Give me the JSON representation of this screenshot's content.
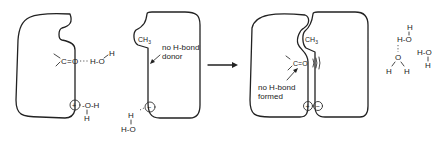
{
  "diagram": {
    "left_protein": {
      "carbonyl_C": "C",
      "carbonyl_bond": "=",
      "carbonyl_O": "O",
      "water_hbond": "H-O",
      "water_H_top": "H",
      "charge": "+",
      "charged_water_OH": "-O-H",
      "charged_water_H": "H"
    },
    "right_ligand": {
      "methyl": "CH",
      "methyl_sub": "3",
      "annotation_line1": "no H-bond",
      "annotation_line2": "donor",
      "charge": "−",
      "water_H": "H",
      "water_HO": "H-O"
    },
    "arrow_label": "",
    "complex": {
      "methyl": "CH",
      "methyl_sub": "3",
      "carbonyl": "C=O",
      "annotation_line1": "no H-bond",
      "annotation_line2": "formed",
      "charge_pos": "+",
      "charge_neg": "−"
    },
    "released_water": {
      "h1": "H",
      "ho1": "H-O",
      "o2": "O",
      "h2a": "H",
      "h2b": "H",
      "ho3": "H-O",
      "h3": "H"
    }
  }
}
